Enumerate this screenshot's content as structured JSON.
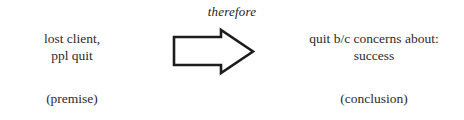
{
  "diagram": {
    "connective": "therefore",
    "premise": {
      "line1": "lost client,",
      "line2": "ppl quit",
      "label": "(premise)"
    },
    "conclusion": {
      "line1": "quit b/c concerns about:",
      "line2": "success",
      "label": "(conclusion)"
    },
    "arrow": {
      "icon": "right-block-arrow-icon",
      "direction": "right",
      "style": "outline",
      "stroke_color": "#1d1d1d",
      "fill_color": "#ffffff"
    },
    "colors": {
      "background": "#ffffff",
      "text": "#2b2b2b",
      "connective_text": "#242424",
      "arrow_stroke": "#1d1d1d"
    }
  }
}
